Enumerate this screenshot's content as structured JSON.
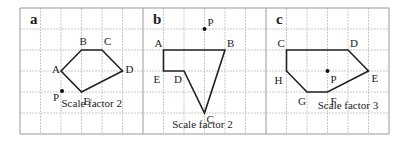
{
  "grid": {
    "x0": 20,
    "y0": 8,
    "cols": 18,
    "rows": 6,
    "cw": 20.5,
    "rh": 21,
    "separators": [
      6,
      12
    ]
  },
  "panels": [
    {
      "label": "a",
      "caption": "Scale factor 2",
      "vertices": [
        [
          "A",
          2,
          3
        ],
        [
          "B",
          3,
          2
        ],
        [
          "C",
          4,
          2
        ],
        [
          "D",
          5,
          3
        ],
        [
          "E",
          3,
          4
        ]
      ],
      "point": [
        "P",
        2.05,
        3.95
      ]
    },
    {
      "label": "b",
      "caption": "Scale factor 2",
      "vertices": [
        [
          "A",
          7,
          2
        ],
        [
          "B",
          10,
          2
        ],
        [
          "C",
          9,
          5
        ],
        [
          "D",
          8,
          3
        ],
        [
          "E",
          7,
          3
        ]
      ],
      "point": [
        "P",
        9,
        1
      ]
    },
    {
      "label": "c",
      "caption": "Scale factor 3",
      "vertices": [
        [
          "C",
          13,
          2
        ],
        [
          "D",
          16,
          2
        ],
        [
          "E",
          17,
          3
        ],
        [
          "F",
          15,
          4
        ],
        [
          "G",
          14,
          4
        ],
        [
          "H",
          13,
          3
        ]
      ],
      "point": [
        "P",
        15,
        3
      ]
    }
  ]
}
